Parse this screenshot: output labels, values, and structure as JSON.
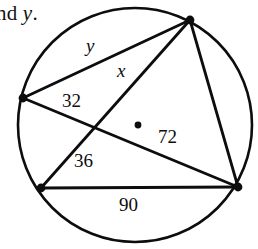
{
  "page": {
    "width": 258,
    "height": 249,
    "background": "#ffffff",
    "ink_color": "#0d0d0d"
  },
  "prompt": {
    "visible_fragment": "nd ",
    "variable": "y",
    "trailing": "."
  },
  "figure": {
    "name": "circle-with-inscribed-chords",
    "circle": {
      "cx": 135,
      "cy": 125,
      "r": 117,
      "stroke": "#0d0d0d",
      "stroke_width": 2.6,
      "fill": "none"
    },
    "center_dot": {
      "cx": 138,
      "cy": 125,
      "r": 3.4
    },
    "points": [
      {
        "id": "top",
        "cx": 190,
        "cy": 20,
        "r": 4.4
      },
      {
        "id": "left",
        "cx": 23,
        "cy": 98,
        "r": 4.4
      },
      {
        "id": "bottom-left",
        "cx": 41,
        "cy": 188,
        "r": 4.4
      },
      {
        "id": "bottom-right",
        "cx": 238,
        "cy": 187,
        "r": 4.4
      }
    ],
    "chords": [
      {
        "id": "left-to-top",
        "x1": 23,
        "y1": 98,
        "x2": 190,
        "y2": 20
      },
      {
        "id": "left-to-bottom-right",
        "x1": 23,
        "y1": 98,
        "x2": 238,
        "y2": 187
      },
      {
        "id": "bottom-left-to-top",
        "x1": 41,
        "y1": 188,
        "x2": 190,
        "y2": 20
      },
      {
        "id": "bottom-left-to-bottom-right",
        "x1": 41,
        "y1": 188,
        "x2": 238,
        "y2": 187
      },
      {
        "id": "top-to-bottom-right",
        "x1": 190,
        "y1": 20,
        "x2": 238,
        "y2": 187
      }
    ],
    "chord_intersection": {
      "x": 92,
      "y": 129
    }
  },
  "labels": [
    {
      "id": "arc-y",
      "text": "y",
      "kind": "variable",
      "x": 86,
      "y": 36
    },
    {
      "id": "arc-x",
      "text": "x",
      "kind": "variable",
      "x": 117,
      "y": 61
    },
    {
      "id": "arc-32",
      "text": "32",
      "kind": "number",
      "x": 62,
      "y": 91
    },
    {
      "id": "arc-72",
      "text": "72",
      "kind": "number",
      "x": 158,
      "y": 127
    },
    {
      "id": "arc-36",
      "text": "36",
      "kind": "number",
      "x": 74,
      "y": 151
    },
    {
      "id": "arc-90",
      "text": "90",
      "kind": "number",
      "x": 119,
      "y": 195
    }
  ]
}
